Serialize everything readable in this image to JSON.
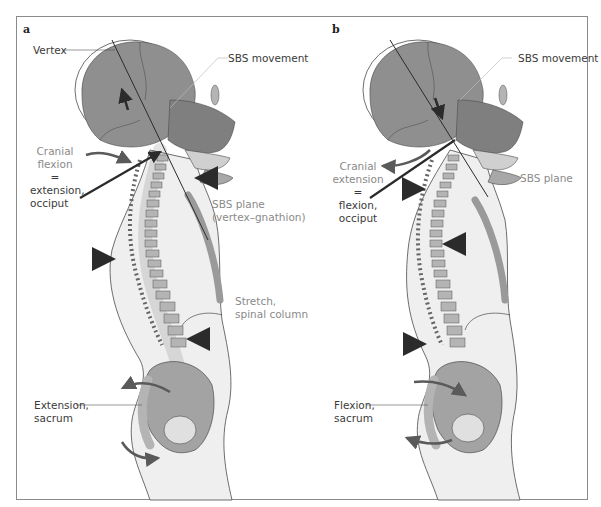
{
  "figure": {
    "panels": [
      {
        "letter": "a",
        "labels": {
          "vertex": "Vertex",
          "sbs_movement": "SBS movement",
          "cranial_line1": "Cranial",
          "cranial_line2": "flexion",
          "cranial_eq": "=",
          "cranial_line3": "extension,",
          "cranial_line4": "occiput",
          "sbs_plane_line1": "SBS plane",
          "sbs_plane_line2": "(vertex–gnathion)",
          "stretch_line1": "Stretch,",
          "stretch_line2": "spinal column",
          "sacrum_line1": "Extension,",
          "sacrum_line2": "sacrum"
        }
      },
      {
        "letter": "b",
        "labels": {
          "sbs_movement": "SBS movement",
          "cranial_line1": "Cranial",
          "cranial_line2": "extension",
          "cranial_eq": "=",
          "cranial_line3": "flexion,",
          "cranial_line4": "occiput",
          "sbs_plane": "SBS plane",
          "sacrum_line1": "Flexion,",
          "sacrum_line2": "sacrum"
        }
      }
    ],
    "colors": {
      "skull": "#8f8f8f",
      "skull_dark": "#6e6e6e",
      "bone": "#b4b4b4",
      "body_fill": "#efefef",
      "outline": "#4a4a4a",
      "arrow": "#2b2b2b",
      "curved_arrow": "#5a5a5a",
      "label_text": "#3b3b3b",
      "label_grey": "#8a8a8a"
    }
  }
}
